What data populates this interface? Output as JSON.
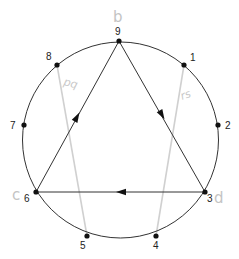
{
  "diagram": {
    "type": "circle-with-9-points-and-directed-triangle",
    "circle": {
      "cx": 120.5,
      "cy": 140,
      "r": 98
    },
    "points": [
      {
        "label": "1",
        "x": 184,
        "y": 65,
        "lx": 190,
        "ly": 61
      },
      {
        "label": "2",
        "x": 218,
        "y": 125,
        "lx": 225,
        "ly": 129
      },
      {
        "label": "3",
        "x": 205,
        "y": 192,
        "lx": 207,
        "ly": 202
      },
      {
        "label": "4",
        "x": 156,
        "y": 236,
        "lx": 153,
        "ly": 249
      },
      {
        "label": "5",
        "x": 87,
        "y": 236,
        "lx": 80,
        "ly": 249
      },
      {
        "label": "6",
        "x": 36,
        "y": 192,
        "lx": 24,
        "ly": 202
      },
      {
        "label": "7",
        "x": 24,
        "y": 125,
        "lx": 10,
        "ly": 129
      },
      {
        "label": "8",
        "x": 57,
        "y": 65,
        "lx": 46,
        "ly": 60
      },
      {
        "label": "9",
        "x": 119,
        "y": 41,
        "lx": 115,
        "ly": 35
      }
    ],
    "directed_edges": [
      {
        "from": "9",
        "to": "3",
        "arrow_at": [
          162,
          115
        ]
      },
      {
        "from": "3",
        "to": "6",
        "arrow_at": [
          121,
          192
        ]
      },
      {
        "from": "6",
        "to": "9",
        "arrow_at": [
          77,
          117
        ]
      }
    ],
    "pencil_chords": [
      {
        "from": "8",
        "to": "5"
      },
      {
        "from": "1",
        "to": "4"
      }
    ],
    "handwritten_labels": [
      {
        "text": "b",
        "x": 113,
        "y": 22,
        "near": "9"
      },
      {
        "text": "pq",
        "x": 63,
        "y": 85,
        "near": "chord 8-5"
      },
      {
        "text": "rs",
        "x": 182,
        "y": 100,
        "near": "chord 1-4"
      },
      {
        "text": "c",
        "x": 12,
        "y": 200,
        "near": "6"
      },
      {
        "text": "d",
        "x": 214,
        "y": 203,
        "near": "3"
      }
    ],
    "colors": {
      "ink": "#222222",
      "pencil": "#d0d0d0",
      "background": "#ffffff"
    }
  }
}
